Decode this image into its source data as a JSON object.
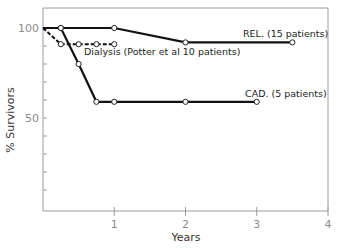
{
  "chart_data": {
    "type": "line",
    "title": "",
    "xlabel": "Years",
    "ylabel": "% Survivors",
    "xlim": [
      0,
      4
    ],
    "ylim": [
      0,
      110
    ],
    "xticks": [
      1,
      2,
      3,
      4
    ],
    "xtick_labels": [
      "1",
      "2",
      "3",
      "4"
    ],
    "yticks_labeled": [
      100,
      50
    ],
    "ytick_labels": [
      "100",
      "50"
    ],
    "yticks_minor": [
      10,
      20,
      30,
      40,
      60,
      70,
      80,
      90
    ],
    "grid": false,
    "series": [
      {
        "name": "REL. (15 patients)",
        "style": "solid",
        "x": [
          0,
          0.25,
          1,
          2,
          3.5
        ],
        "y": [
          100,
          100,
          100,
          92,
          92
        ]
      },
      {
        "name": "Dialysis (Potter et al 10 patients)",
        "style": "dashed",
        "x": [
          0,
          0.25,
          0.5,
          0.75,
          1
        ],
        "y": [
          100,
          91,
          91,
          91,
          91
        ]
      },
      {
        "name": "CAD. (5 patients)",
        "style": "solid",
        "x": [
          0,
          0.25,
          0.5,
          0.75,
          1,
          2,
          3
        ],
        "y": [
          100,
          100,
          80,
          59,
          59,
          59,
          59
        ]
      }
    ],
    "annotations": [
      {
        "text": "REL. (15 patients)",
        "series": 0
      },
      {
        "text": "Dialysis (Potter et al 10 patients)",
        "series": 1
      },
      {
        "text": "CAD. (5 patients)",
        "series": 2
      }
    ]
  }
}
